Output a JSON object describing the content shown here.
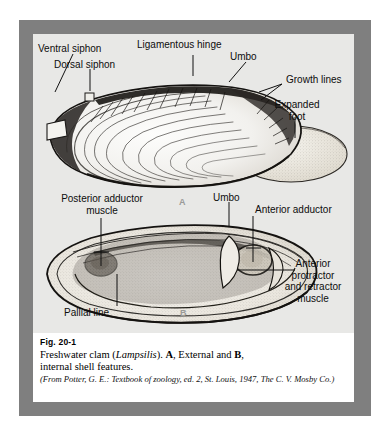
{
  "figure": {
    "number": "Fig. 20-1",
    "caption_parts": {
      "lead": "Freshwater clam (",
      "genus": "Lampsilis",
      "mid": "). ",
      "a": "A",
      "mid2": ", External and ",
      "b": "B",
      "tail": ",",
      "line2": "internal shell features."
    },
    "source": "(From Potter, G. E.: Textbook of zoology, ed. 2, St. Louis, 1947, The C. V. Mosby Co.)",
    "panels": [
      {
        "id": "A",
        "title": "External shell features"
      },
      {
        "id": "B",
        "title": "Internal shell features"
      }
    ]
  },
  "labels": {
    "panel_a": [
      {
        "name": "ventral-siphon",
        "text": "Ventral siphon"
      },
      {
        "name": "dorsal-siphon",
        "text": "Dorsal siphon"
      },
      {
        "name": "ligamentous-hinge",
        "text": "Ligamentous hinge"
      },
      {
        "name": "umbo-a",
        "text": "Umbo"
      },
      {
        "name": "growth-lines",
        "text": "Growth lines"
      },
      {
        "name": "expanded-foot",
        "text": "Expanded\nfoot"
      }
    ],
    "panel_b": [
      {
        "name": "posterior-adductor-muscle",
        "text": "Posterior adductor\nmuscle"
      },
      {
        "name": "umbo-b",
        "text": "Umbo"
      },
      {
        "name": "anterior-adductor",
        "text": "Anterior adductor"
      },
      {
        "name": "anterior-protractor-and-retractor-muscle",
        "text": "Anterior\nprotractor\nand retractor\nmuscle"
      },
      {
        "name": "pallial-line",
        "text": "Pallial line"
      }
    ]
  },
  "colors": {
    "frame": "#7f7f7f",
    "plate": "#e8e8e6",
    "caption_bg": "#ffffff",
    "text": "#0d0d0d",
    "panel_id": "#9a9a98"
  }
}
